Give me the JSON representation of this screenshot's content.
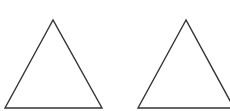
{
  "diagram": {
    "background": "#ffffff",
    "stroke_color": "#333333",
    "stroke_width": 1.4,
    "shapes": [
      {
        "type": "triangle",
        "name": "left-triangle",
        "points": [
          [
            53,
            20
          ],
          [
            5,
            108
          ],
          [
            102,
            108
          ]
        ]
      },
      {
        "type": "triangle",
        "name": "right-triangle",
        "points": [
          [
            186,
            20
          ],
          [
            138,
            108
          ],
          [
            234,
            108
          ]
        ]
      }
    ]
  }
}
